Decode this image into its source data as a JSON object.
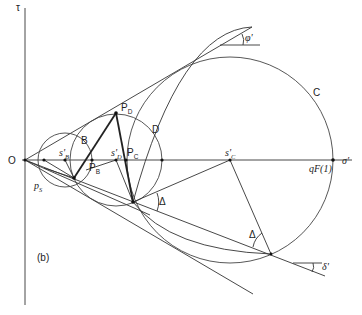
{
  "figure": {
    "panel_label": "(b)",
    "axes": {
      "vertical": "τ",
      "horizontal": "σ'",
      "origin": "O"
    },
    "circles": [
      {
        "label": "B",
        "center_label": "s'B"
      },
      {
        "label": "D",
        "center_label": "s'D"
      },
      {
        "label": "C",
        "center_label": "s'C"
      }
    ],
    "points": {
      "pS": "pS",
      "PB": "PB",
      "PC": "PC",
      "PD": "PD",
      "qF": "qF(1)"
    },
    "angles": {
      "phi": "φ'",
      "delta": "δ'",
      "Delta": "Δ"
    }
  }
}
